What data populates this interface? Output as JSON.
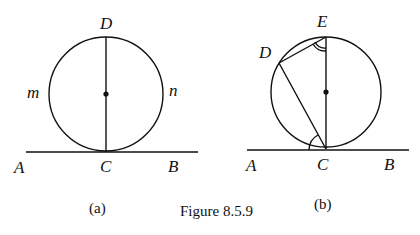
{
  "figure": {
    "caption": "Figure 8.5.9",
    "panels": [
      {
        "id": "a",
        "sub_caption": "(a)",
        "labels": {
          "D": "D",
          "m": "m",
          "n": "n",
          "A": "A",
          "C": "C",
          "B": "B"
        }
      },
      {
        "id": "b",
        "sub_caption": "(b)",
        "labels": {
          "E": "E",
          "D": "D",
          "A": "A",
          "C": "C",
          "B": "B"
        }
      }
    ]
  }
}
